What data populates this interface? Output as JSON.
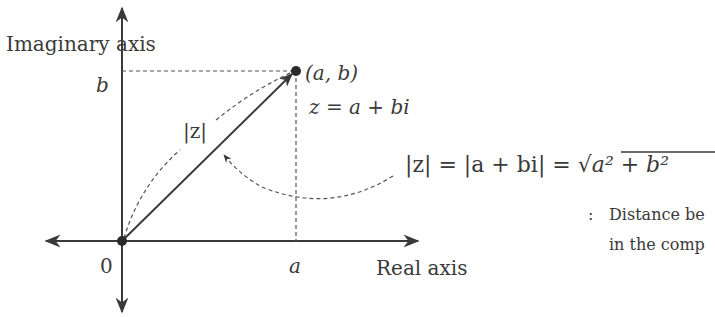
{
  "diagram": {
    "axes": {
      "imaginary_label": "Imaginary axis",
      "real_label": "Real axis",
      "origin_label": "0",
      "b_tick_label": "b",
      "a_tick_label": "a"
    },
    "point": {
      "label": "(a, b)",
      "equation": "z = a + bi"
    },
    "vector_label": "|z|",
    "formula": {
      "lhs": "|z| = |a + bi| = ",
      "sqrt_symbol": "√",
      "radicand": "a² + b²"
    },
    "description": {
      "bullet": ":",
      "line1": "Distance be",
      "line2": "in the comp"
    },
    "colors": {
      "ink": "#3a3a3a",
      "background": "#ffffff"
    }
  }
}
